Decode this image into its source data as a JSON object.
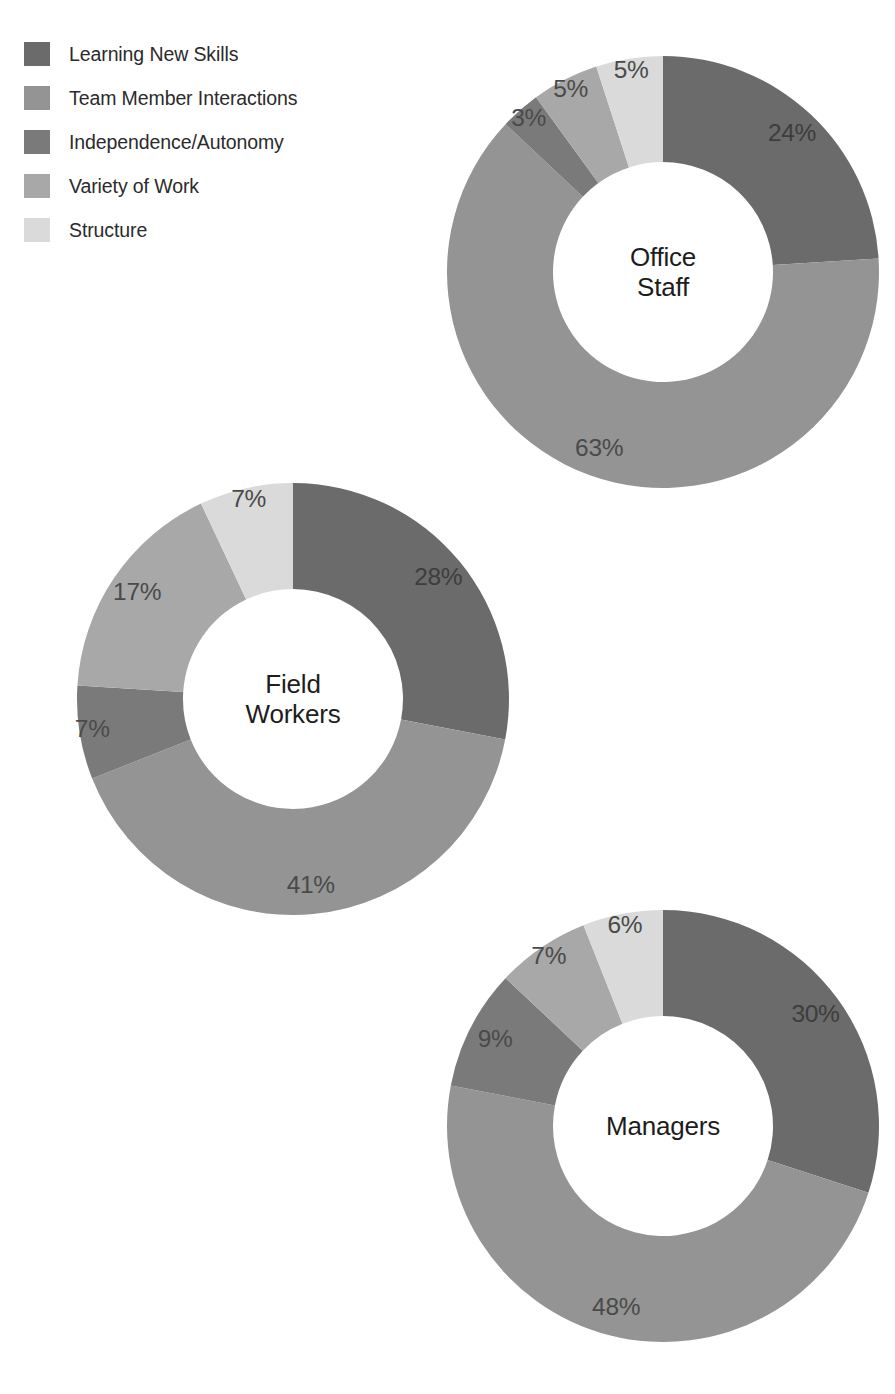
{
  "legend": {
    "items": [
      {
        "label": "Learning New Skills",
        "color": "#6b6b6b"
      },
      {
        "label": "Team Member Interactions",
        "color": "#949494"
      },
      {
        "label": "Independence/Autonomy",
        "color": "#7a7a7a"
      },
      {
        "label": "Variety of Work",
        "color": "#a8a8a8"
      },
      {
        "label": "Structure",
        "color": "#dadada"
      }
    ]
  },
  "chart_data": {
    "type": "pie",
    "title": "",
    "variant": "donut",
    "legend_position": "top-left",
    "grid": false,
    "categories": [
      "Learning New Skills",
      "Team Member Interactions",
      "Independence/Autonomy",
      "Variety of Work",
      "Structure"
    ],
    "colors": [
      "#6b6b6b",
      "#949494",
      "#7a7a7a",
      "#a8a8a8",
      "#dadada"
    ],
    "value_suffix": "%",
    "start_angle_deg": 0,
    "direction": "clockwise",
    "charts": [
      {
        "name": "office-staff",
        "center_label": "Office\nStaff",
        "values": [
          24,
          63,
          3,
          5,
          5
        ],
        "labels": [
          "24%",
          "63%",
          "3%",
          "5%",
          "5%"
        ],
        "cx": 663,
        "cy": 272,
        "r_outer": 216,
        "r_inner": 110
      },
      {
        "name": "field-workers",
        "center_label": "Field\nWorkers",
        "values": [
          28,
          41,
          7,
          17,
          7
        ],
        "labels": [
          "28%",
          "41%",
          "7%",
          "17%",
          "7%"
        ],
        "cx": 293,
        "cy": 699,
        "r_outer": 216,
        "r_inner": 110
      },
      {
        "name": "managers",
        "center_label": "Managers",
        "values": [
          30,
          48,
          9,
          7,
          6
        ],
        "labels": [
          "30%",
          "48%",
          "9%",
          "7%",
          "6%"
        ],
        "cx": 663,
        "cy": 1126,
        "r_outer": 216,
        "r_inner": 110
      }
    ]
  }
}
